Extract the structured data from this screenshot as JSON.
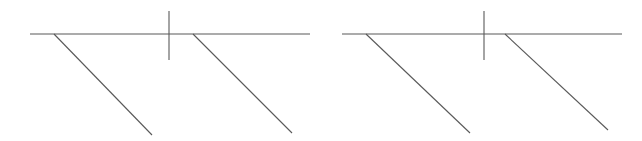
{
  "canvas": {
    "width": 642,
    "height": 141,
    "background_color": "#ffffff"
  },
  "style": {
    "stroke_color": "#595959",
    "stroke_width": 1.1,
    "baseline_stroke_width": 1.1,
    "tick_stroke_width": 1.1,
    "diagonal_stroke_width": 1.1
  },
  "chart_data": {
    "type": "line",
    "title": "",
    "subtitle": "",
    "xlabel": "",
    "ylabel": "",
    "grid": false,
    "legend": null,
    "xlim": [
      0,
      642
    ],
    "ylim": [
      141,
      0
    ],
    "figure_count": 2,
    "series": [
      {
        "name": "figure-1-baseline",
        "figure": 1,
        "role": "baseline",
        "points": [
          [
            30,
            34
          ],
          [
            310,
            34
          ]
        ]
      },
      {
        "name": "figure-1-tick",
        "figure": 1,
        "role": "vertical-tick",
        "points": [
          [
            169,
            11
          ],
          [
            169,
            60
          ]
        ]
      },
      {
        "name": "figure-1-diagonal-1",
        "figure": 1,
        "role": "diagonal",
        "points": [
          [
            54,
            34
          ],
          [
            152,
            135
          ]
        ]
      },
      {
        "name": "figure-1-diagonal-2",
        "figure": 1,
        "role": "diagonal",
        "points": [
          [
            193,
            34
          ],
          [
            292,
            133
          ]
        ]
      },
      {
        "name": "figure-2-baseline",
        "figure": 2,
        "role": "baseline",
        "points": [
          [
            342,
            34
          ],
          [
            622,
            34
          ]
        ]
      },
      {
        "name": "figure-2-tick",
        "figure": 2,
        "role": "vertical-tick",
        "points": [
          [
            484,
            11
          ],
          [
            484,
            60
          ]
        ]
      },
      {
        "name": "figure-2-diagonal-1",
        "figure": 2,
        "role": "diagonal",
        "points": [
          [
            366,
            34
          ],
          [
            470,
            133
          ]
        ]
      },
      {
        "name": "figure-2-diagonal-2",
        "figure": 2,
        "role": "diagonal",
        "points": [
          [
            505,
            34
          ],
          [
            608,
            130
          ]
        ]
      }
    ]
  }
}
